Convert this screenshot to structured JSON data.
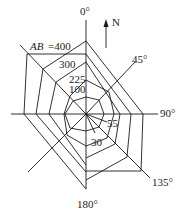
{
  "diagram": {
    "type": "polar-contour-diagram",
    "north_label": "N",
    "angle_labels": {
      "a0": "0°",
      "a45": "45°",
      "a90": "90°",
      "a135": "135°",
      "a180": "180°"
    },
    "contour_labels": {
      "ab": "AB",
      "ab_value": "=400",
      "c300": "300",
      "c225": "225",
      "c100": "100",
      "c55": "55",
      "c30": "30"
    },
    "colors": {
      "line": "#1a1a1a",
      "text": "#222222",
      "background": "#ffffff"
    }
  }
}
